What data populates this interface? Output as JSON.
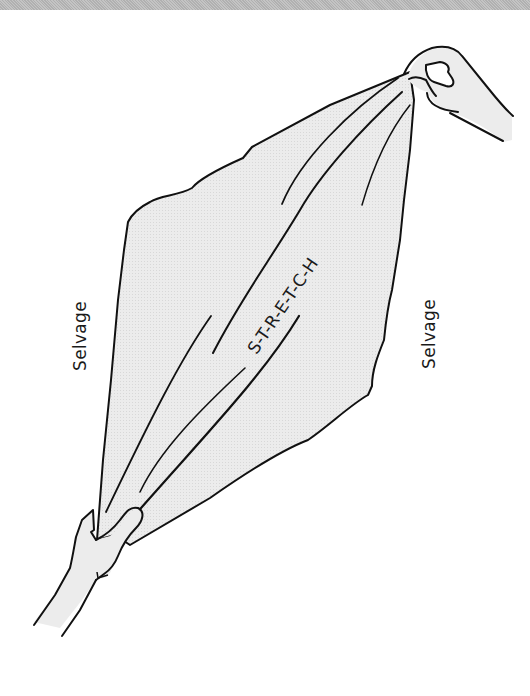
{
  "figure": {
    "labels": {
      "selvage_left": "Selvage",
      "selvage_right": "Selvage",
      "stretch": "S-T-R-E-T-C-H"
    },
    "colors": {
      "fabric_fill": "#e9e9e9",
      "outline": "#111111",
      "background": "#ffffff",
      "top_band": "#bdbdbd"
    },
    "elements": [
      "fabric-piece",
      "top-right-hand",
      "bottom-left-hand",
      "stretch-folds"
    ]
  }
}
